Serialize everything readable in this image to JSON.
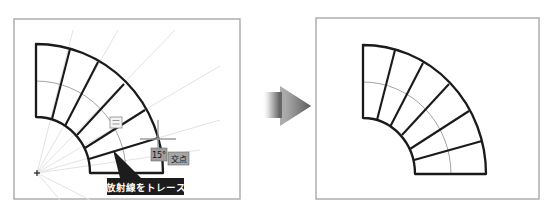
{
  "panels": {
    "before": {
      "frame": {
        "x": 14,
        "y": 19,
        "w": 226,
        "h": 180
      },
      "center": [
        36,
        173
      ],
      "outer": {
        "rx": 127,
        "ry": 129
      },
      "inner": {
        "rx": 54,
        "ry": 56
      },
      "guide_arc": {
        "rx": 90,
        "ry": 92
      },
      "steps": [
        [
          [
            70,
            49
          ],
          [
            52,
            119
          ]
        ],
        [
          [
            98,
            62
          ],
          [
            65,
            126
          ]
        ],
        [
          [
            124,
            84
          ],
          [
            77,
            135
          ]
        ],
        [
          [
            145,
            110
          ],
          [
            85,
            148
          ]
        ],
        [
          [
            158,
            138
          ],
          [
            89,
            159
          ]
        ]
      ],
      "rays_end": [
        [
          73,
          30
        ],
        [
          118,
          30
        ],
        [
          175,
          30
        ],
        [
          220,
          66
        ],
        [
          220,
          120
        ],
        [
          200,
          150
        ],
        [
          90,
          200
        ],
        [
          60,
          200
        ]
      ],
      "origin_marker": [
        37,
        173
      ],
      "snap_marker": {
        "x": 110,
        "y": 117,
        "w": 12,
        "h": 11
      },
      "crosshair": {
        "cx": 158,
        "cy": 139,
        "h_len": 18,
        "v_up": 19,
        "v_down": 11
      },
      "angle_badge": {
        "x": 151,
        "y": 148,
        "w": 16,
        "h": 13,
        "text": "15°"
      },
      "intersection_badge": {
        "x": 168,
        "y": 152,
        "w": 21,
        "h": 13,
        "text": "交点"
      },
      "callout": {
        "x": 107,
        "y": 178,
        "w": 77,
        "h": 17,
        "text": "放射線をトレース",
        "pointer": [
          [
            113,
            150
          ],
          [
            120,
            178
          ],
          [
            141,
            178
          ]
        ]
      }
    },
    "after": {
      "frame": {
        "x": 316,
        "y": 18,
        "w": 223,
        "h": 181
      },
      "center": [
        363,
        174
      ],
      "outer": {
        "rx": 123,
        "ry": 129
      },
      "inner": {
        "rx": 52,
        "ry": 56
      },
      "guide_arc": {
        "rx": 88,
        "ry": 92
      },
      "steps": [
        [
          [
            395,
            50
          ],
          [
            377,
            120
          ]
        ],
        [
          [
            423,
            63
          ],
          [
            390,
            127
          ]
        ],
        [
          [
            449,
            84
          ],
          [
            402,
            135
          ]
        ],
        [
          [
            469,
            111
          ],
          [
            410,
            149
          ]
        ],
        [
          [
            482,
            141
          ],
          [
            414,
            160
          ]
        ]
      ]
    }
  },
  "arrow": {
    "label": "transition-arrow",
    "colors": {
      "dark": "#555555",
      "light": "#ffffff"
    }
  },
  "colors": {
    "frame": "#a8a8a8",
    "ink": "#1a1a1a",
    "guide": "#9a9a9a",
    "badge": "#9e9e9e",
    "callout": "#1c1c1c"
  }
}
